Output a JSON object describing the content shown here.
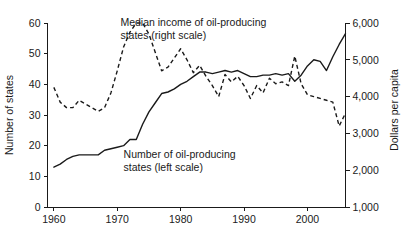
{
  "chart_data": {
    "type": "line",
    "title": "",
    "xlabel": "",
    "ylabel": "Number of states",
    "y2label": "Dollars per capita",
    "xlim": [
      1959,
      2006
    ],
    "ylim": [
      0,
      60
    ],
    "y2lim": [
      1000,
      6000
    ],
    "grid": false,
    "legend": "annotations",
    "xticks": [
      1960,
      1970,
      1980,
      1990,
      2000
    ],
    "xtick_labels": [
      "1960",
      "1970",
      "1980",
      "1990",
      "2000"
    ],
    "yticks": [
      0,
      10,
      20,
      30,
      40,
      50,
      60
    ],
    "ytick_labels": [
      "0",
      "10",
      "20",
      "30",
      "40",
      "50",
      "60"
    ],
    "y2ticks": [
      1000,
      2000,
      3000,
      4000,
      5000,
      6000
    ],
    "y2tick_labels": [
      "1,000",
      "2,000",
      "3,000",
      "4,000",
      "5,000",
      "6,000"
    ],
    "annotations": [
      {
        "id": "annotation-median-income",
        "lines": [
          "Median income of oil-producing",
          "states (right scale)"
        ],
        "x": 1970.5,
        "y": 59
      },
      {
        "id": "annotation-number-of-states",
        "lines": [
          "Number of oil-producing",
          "states (left scale)"
        ],
        "x": 1971.0,
        "y": 16
      }
    ],
    "series": [
      {
        "name": "Number of oil-producing states (left scale)",
        "axis": "left",
        "style": "solid",
        "units": "states",
        "x": [
          1960,
          1961,
          1962,
          1963,
          1964,
          1965,
          1966,
          1967,
          1968,
          1969,
          1970,
          1971,
          1972,
          1973,
          1974,
          1975,
          1976,
          1977,
          1978,
          1979,
          1980,
          1981,
          1982,
          1983,
          1984,
          1985,
          1986,
          1987,
          1988,
          1989,
          1990,
          1991,
          1992,
          1993,
          1994,
          1995,
          1996,
          1997,
          1998,
          1999,
          2000,
          2001,
          2002,
          2003,
          2004,
          2005,
          2006
        ],
        "values": [
          13,
          14,
          15.5,
          16.5,
          17,
          17,
          17,
          17,
          18.5,
          19,
          19.5,
          20,
          22,
          22,
          27,
          31,
          34,
          37,
          37.5,
          38.5,
          40,
          41,
          42.5,
          44,
          44,
          43.5,
          44,
          44.5,
          44,
          44.5,
          43.5,
          42.5,
          42.5,
          43,
          43,
          43.5,
          43,
          43.5,
          41,
          43,
          46,
          48,
          47.5,
          44.5,
          49,
          53,
          56.5
        ]
      },
      {
        "name": "Median income of oil-producing states (right scale)",
        "axis": "right",
        "style": "dashed",
        "units": "dollars per capita",
        "x": [
          1960,
          1961,
          1962,
          1963,
          1964,
          1965,
          1966,
          1967,
          1968,
          1969,
          1970,
          1971,
          1972,
          1973,
          1974,
          1975,
          1976,
          1977,
          1978,
          1979,
          1980,
          1981,
          1982,
          1983,
          1984,
          1985,
          1986,
          1987,
          1988,
          1989,
          1990,
          1991,
          1992,
          1993,
          1994,
          1995,
          1996,
          1997,
          1998,
          1999,
          2000,
          2001,
          2002,
          2003,
          2004,
          2005,
          2006
        ],
        "values": [
          4250,
          3850,
          3700,
          3700,
          3900,
          3800,
          3700,
          3600,
          3700,
          4100,
          4700,
          5350,
          5750,
          6000,
          6000,
          5700,
          5200,
          4700,
          4800,
          5050,
          5300,
          5000,
          4650,
          4850,
          4550,
          4300,
          4000,
          4600,
          4400,
          4550,
          4300,
          3950,
          4300,
          4100,
          4500,
          4350,
          4400,
          4300,
          5100,
          4350,
          4050,
          4000,
          3950,
          3900,
          3850,
          3200,
          3550
        ]
      }
    ]
  }
}
